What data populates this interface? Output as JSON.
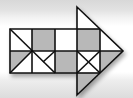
{
  "figure": {
    "colors": {
      "shaded": "#b8b8b8",
      "unshaded": "#ffffff",
      "stroke": "#111111",
      "background": "#e4e4e4"
    },
    "grid": {
      "rows": 2,
      "cols": 4
    },
    "arrow_direction": "right"
  }
}
